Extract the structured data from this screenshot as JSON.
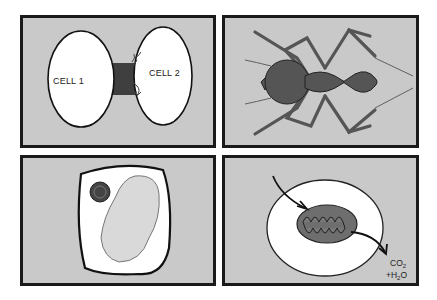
{
  "figure": {
    "layout": "2x2 grid of illustration panels",
    "colors": {
      "panel_bg": "#c9c9c9",
      "border": "#1a1a1a",
      "cell_fill": "#ffffff",
      "dark_fill": "#555555",
      "organelle_fill": "#6e6e6e"
    },
    "panels": [
      {
        "id": "top-left",
        "subject": "two cells connected by a junction",
        "labels": {
          "cell1": "CELL 1",
          "cell2": "CELL 2"
        }
      },
      {
        "id": "top-right",
        "subject": "ant (dorsal view)"
      },
      {
        "id": "bottom-left",
        "subject": "plant cell with nucleus and large vacuole"
      },
      {
        "id": "bottom-right",
        "subject": "mitochondrion within cell, input and output arrows",
        "labels": {
          "output_line1_main": "CO",
          "output_line1_sub": "2",
          "output_line2_prefix": "+H",
          "output_line2_sub": "2",
          "output_line2_suffix": "O"
        }
      }
    ]
  }
}
